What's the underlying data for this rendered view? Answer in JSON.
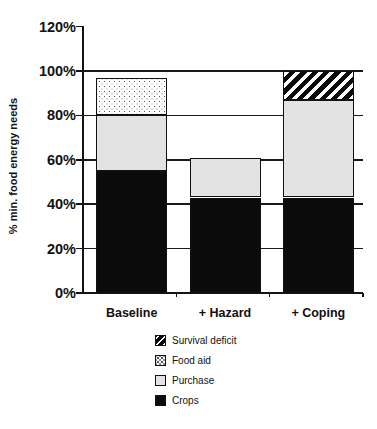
{
  "chart_data": {
    "type": "bar",
    "stacked": true,
    "title": "",
    "ylabel": "% min. food energy needs",
    "xlabel": "",
    "categories": [
      "Baseline",
      "+ Hazard",
      "+ Coping"
    ],
    "series": [
      {
        "name": "Crops",
        "pattern": "solid-black",
        "values": [
          55,
          43,
          43
        ]
      },
      {
        "name": "Purchase",
        "pattern": "light-gray",
        "values": [
          25,
          18,
          44
        ]
      },
      {
        "name": "Food aid",
        "pattern": "dotted",
        "values": [
          17,
          0,
          0
        ]
      },
      {
        "name": "Survival deficit",
        "pattern": "diagonal-hatch",
        "values": [
          0,
          0,
          13
        ]
      }
    ],
    "bar_totals_pct": [
      97,
      61,
      100
    ],
    "ylim": [
      0,
      120
    ],
    "yticks": [
      0,
      20,
      40,
      60,
      80,
      100,
      120
    ],
    "ytick_labels": [
      "0%",
      "20%",
      "40%",
      "60%",
      "80%",
      "100%",
      "120%"
    ],
    "gridlines_at": [
      20,
      40,
      60,
      80,
      100
    ],
    "legend": {
      "position": "bottom",
      "entries": [
        {
          "label": "Survival deficit",
          "pattern": "diagonal-hatch"
        },
        {
          "label": "Food aid",
          "pattern": "dotted"
        },
        {
          "label": "Purchase",
          "pattern": "light-gray"
        },
        {
          "label": "Crops",
          "pattern": "solid-black"
        }
      ]
    },
    "colors": {
      "bar_black": "#0b0b0b",
      "bar_light_gray": "#e3e3e3",
      "pattern_ink": "#111111",
      "axis_line": "#141414",
      "background": "#ffffff"
    }
  }
}
